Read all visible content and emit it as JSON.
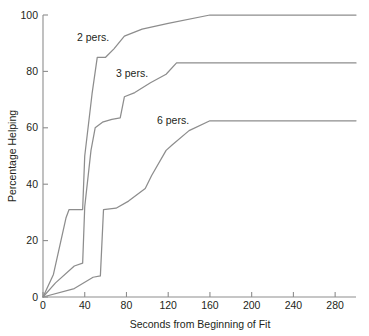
{
  "chart_data": {
    "type": "line",
    "title": "",
    "xlabel": "Seconds from Beginning of Fit",
    "ylabel": "Percentage Helping",
    "xlim": [
      0,
      300
    ],
    "ylim": [
      0,
      100
    ],
    "xticks": [
      0,
      40,
      80,
      120,
      160,
      200,
      240,
      280
    ],
    "yticks": [
      0,
      20,
      40,
      60,
      80,
      100
    ],
    "xticklabels": [
      "0",
      "40",
      "80",
      "120",
      "160",
      "200",
      "240",
      "280"
    ],
    "yticklabels": [
      "0",
      "20",
      "40",
      "60",
      "80",
      "100"
    ],
    "grid": false,
    "legend_position": "inline-annotations",
    "line_color": "#8d8d8d",
    "axis_color": "#8d8d8d",
    "background": "#ffffff",
    "series": [
      {
        "name": "2 pers.",
        "label": "2 pers.",
        "plateau_value": 100,
        "plateau_seconds": 160,
        "x": [
          0,
          10,
          22,
          25,
          38,
          40,
          47,
          52,
          60,
          68,
          78,
          95,
          120,
          160,
          300
        ],
        "y": [
          0,
          8,
          28,
          31,
          31,
          50,
          72,
          85,
          85,
          88,
          92.5,
          95,
          97,
          100,
          100
        ]
      },
      {
        "name": "3 pers.",
        "label": "3 pers.",
        "plateau_value": 83,
        "plateau_seconds": 128,
        "x": [
          0,
          12,
          30,
          38,
          40,
          46,
          50,
          57,
          66,
          74,
          78,
          88,
          103,
          118,
          128,
          300
        ],
        "y": [
          0,
          5,
          11,
          12,
          32,
          52,
          60,
          62,
          63,
          63.5,
          71,
          72.5,
          76,
          79,
          83,
          83
        ]
      },
      {
        "name": "6 pers.",
        "label": "6 pers.",
        "plateau_value": 62.5,
        "plateau_seconds": 160,
        "x": [
          0,
          30,
          48,
          55,
          58,
          70,
          82,
          98,
          104,
          118,
          124,
          140,
          160,
          300
        ],
        "y": [
          0,
          3,
          7,
          7.5,
          31,
          31.5,
          34,
          38.5,
          43,
          52,
          54,
          59,
          62.5,
          62.5
        ]
      }
    ],
    "annotations": [
      {
        "text": "2 pers.",
        "x_px": 77,
        "y_px": 41
      },
      {
        "text": "3 pers.",
        "x_px": 116,
        "y_px": 77
      },
      {
        "text": "6 pers.",
        "x_px": 157,
        "y_px": 124
      }
    ]
  }
}
